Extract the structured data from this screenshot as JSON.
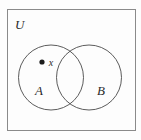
{
  "figure": {
    "type": "venn-diagram",
    "background_color": "#fdfdfd",
    "stroke_color": "#555555",
    "text_color": "#2b2b2b",
    "universe": {
      "label": "U",
      "shape": "rectangle",
      "x": 7,
      "y": 9,
      "width": 129,
      "height": 122,
      "label_x": 15,
      "label_y": 29
    },
    "sets": [
      {
        "name": "set-a",
        "label": "A",
        "cx": 51,
        "cy": 77.5,
        "r": 32.5,
        "label_x": 39,
        "label_y": 95
      },
      {
        "name": "set-b",
        "label": "B",
        "cx": 89,
        "cy": 77.5,
        "r": 32.5,
        "label_x": 101,
        "label_y": 95
      }
    ],
    "points": [
      {
        "name": "element-x",
        "label": "x",
        "cx": 42,
        "cy": 62,
        "r": 2.6,
        "label_x": 51,
        "label_y": 65.5,
        "member_of": "A"
      }
    ]
  }
}
